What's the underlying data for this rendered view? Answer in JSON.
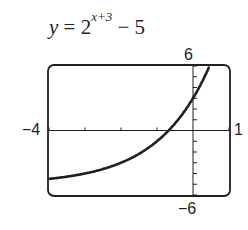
{
  "chart_data": {
    "type": "line",
    "function": "y = 2^(x+3) - 5",
    "xlabel": "",
    "ylabel": "",
    "xlim": [
      -4,
      1
    ],
    "ylim": [
      -6,
      6
    ],
    "x_tick_step": 1,
    "y_tick_step": 1,
    "window_labels": {
      "xmin": "−4",
      "xmax": "1",
      "ymin": "−6",
      "ymax": "6"
    },
    "grid": false,
    "x": [
      -4,
      -3.5,
      -3,
      -2.5,
      -2,
      -1.5,
      -1,
      -0.5,
      0,
      0.5
    ],
    "values": [
      -4.5,
      -4.29,
      -4,
      -3.59,
      -3,
      -2.17,
      -1,
      0.66,
      3,
      6.31
    ]
  },
  "equation": {
    "lhs": "y",
    "eq": " = 2",
    "exp": "x+3",
    "tail": " − 5"
  }
}
